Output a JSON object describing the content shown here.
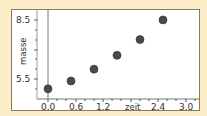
{
  "chart_data": {
    "type": "scatter",
    "title": "",
    "xlabel": "zeit",
    "ylabel": "masse",
    "x": [
      0.0,
      0.5,
      1.0,
      1.5,
      2.0,
      2.5
    ],
    "y": [
      5.0,
      5.4,
      6.0,
      6.7,
      7.5,
      8.5
    ],
    "xlim": [
      -0.2,
      3.15
    ],
    "ylim": [
      4.5,
      9.0
    ],
    "x_ticks": [
      "0.0",
      "0.6",
      "1.2",
      "2.4",
      "3.0"
    ],
    "y_ticks": [
      "5.5",
      "8.5"
    ],
    "grid": false,
    "legend": null,
    "colors": {
      "point": "#4a4a4a",
      "background": "#fbeec9",
      "plot_bg": "#ffffff"
    }
  },
  "labels": {
    "x0": "0.0",
    "x1": "0.6",
    "x2": "1.2",
    "xtitle": "zeit",
    "x4": "2.4",
    "x5": "3.0",
    "y_top": "8.5",
    "y_bottom": "5.5",
    "ytitle": "masse"
  }
}
